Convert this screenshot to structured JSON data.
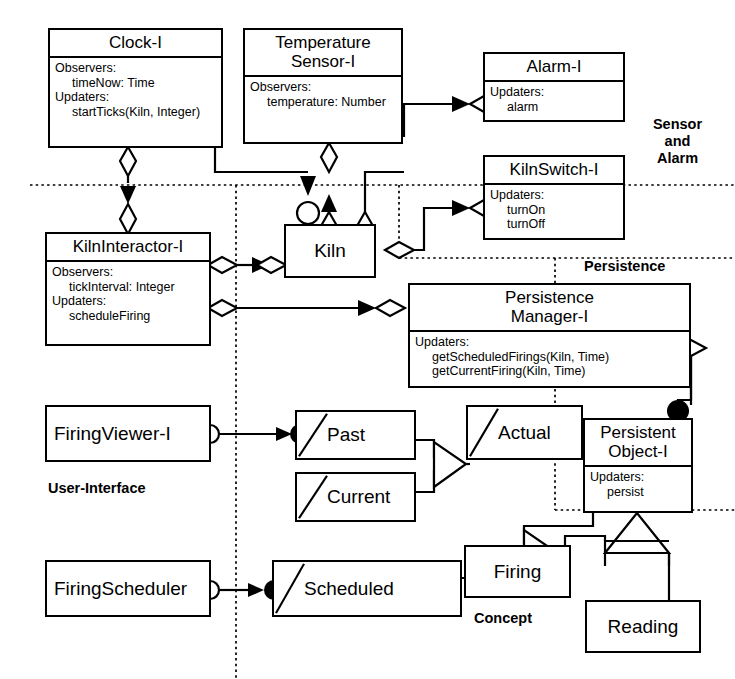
{
  "diagram": {
    "boxes": [
      {
        "id": "clock",
        "name": "Clock-I",
        "title": "Clock-I",
        "body_lines": [
          "Observers:",
          "  timeNow: Time",
          "Updaters:",
          "  startTicks(Kiln, Integer)"
        ]
      },
      {
        "id": "temperature-sensor",
        "name": "Temperature Sensor-I",
        "title": "Temperature\nSensor-I",
        "body_lines": [
          "Observers:",
          "  temperature: Number"
        ]
      },
      {
        "id": "alarm",
        "name": "Alarm-I",
        "title": "Alarm-I",
        "body_lines": [
          "Updaters:",
          "  alarm"
        ]
      },
      {
        "id": "kiln-switch",
        "name": "KilnSwitch-I",
        "title": "KilnSwitch-I",
        "body_lines": [
          "Updaters:",
          "  turnOn",
          "  turnOff"
        ]
      },
      {
        "id": "kiln-interactor",
        "name": "KilnInteractor-I",
        "title": "KilnInteractor-I",
        "body_lines": [
          "Observers:",
          "  tickInterval: Integer",
          "Updaters:",
          "  scheduleFiring"
        ]
      },
      {
        "id": "persistence-manager",
        "name": "Persistence Manager-I",
        "title": "Persistence\nManager-I",
        "body_lines": [
          "Updaters:",
          "  getScheduledFirings(Kiln, Time)",
          "  getCurrentFiring(Kiln, Time)"
        ]
      },
      {
        "id": "persistent-object",
        "name": "Persistent Object-I",
        "title": "Persistent\nObject-I",
        "body_lines": [
          "Updaters:",
          "  persist"
        ]
      }
    ],
    "simple_boxes": [
      {
        "id": "kiln",
        "label": "Kiln"
      },
      {
        "id": "firing-viewer",
        "label": "FiringViewer-I"
      },
      {
        "id": "firing-scheduler",
        "label": "FiringScheduler"
      },
      {
        "id": "past",
        "label": "Past"
      },
      {
        "id": "current",
        "label": "Current"
      },
      {
        "id": "actual",
        "label": "Actual"
      },
      {
        "id": "scheduled",
        "label": "Scheduled"
      },
      {
        "id": "firing",
        "label": "Firing"
      },
      {
        "id": "reading",
        "label": "Reading"
      }
    ],
    "regions": [
      {
        "id": "sensor-and-alarm",
        "label": "Sensor\nand\nAlarm"
      },
      {
        "id": "persistence",
        "label": "Persistence"
      },
      {
        "id": "user-interface",
        "label": "User-Interface"
      },
      {
        "id": "concept",
        "label": "Concept"
      }
    ],
    "colors": {
      "line": "#000000",
      "background": "#ffffff",
      "fill": "#ffffff"
    }
  }
}
